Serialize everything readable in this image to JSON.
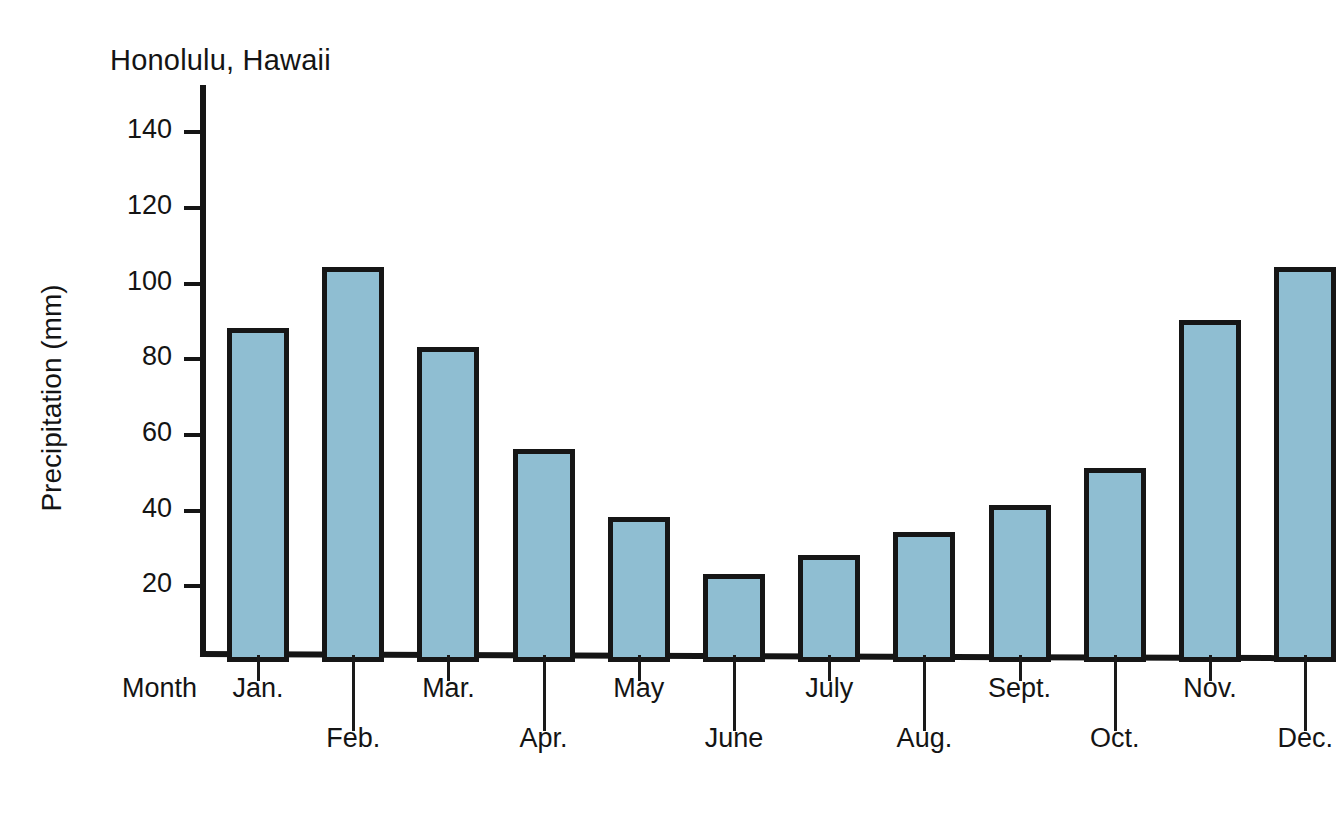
{
  "chart_data": {
    "type": "bar",
    "title": "Honolulu, Hawaii",
    "xlabel": "Month",
    "ylabel": "Precipitation (mm)",
    "categories": [
      "Jan.",
      "Feb.",
      "Mar.",
      "Apr.",
      "May",
      "June",
      "July",
      "Aug.",
      "Sept.",
      "Oct.",
      "Nov.",
      "Dec."
    ],
    "values": [
      86,
      102,
      81,
      54,
      36,
      21,
      26,
      32,
      39,
      49,
      88,
      102
    ],
    "ylim": [
      0,
      150
    ],
    "yticks": [
      20,
      40,
      60,
      80,
      100,
      120,
      140
    ],
    "ytick_labels": [
      "20",
      "40",
      "60",
      "80",
      "100",
      "120",
      "140"
    ],
    "grid": false,
    "legend": null,
    "bar_fill_color": "#8fbed2",
    "bar_edge_color": "#161616",
    "axis_color": "#151515",
    "background_color": "#ffffff",
    "label_rows": [
      0,
      1,
      0,
      1,
      0,
      1,
      0,
      1,
      0,
      1,
      0,
      1
    ]
  }
}
